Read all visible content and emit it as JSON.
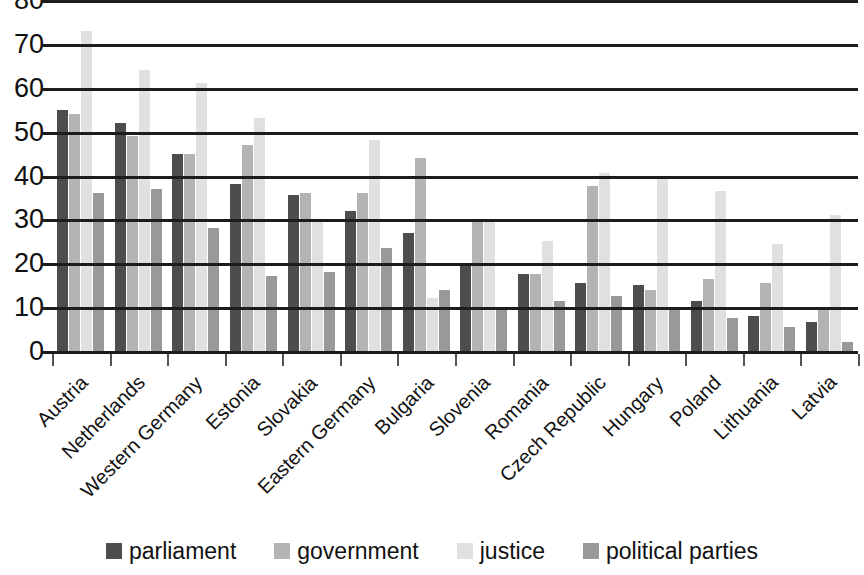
{
  "chart_data": {
    "type": "bar",
    "title": "",
    "subtitle": "",
    "xlabel": "",
    "ylabel": "",
    "ylim": [
      0,
      80
    ],
    "yticks": [
      0,
      10,
      20,
      30,
      40,
      50,
      60,
      70,
      80
    ],
    "grid": true,
    "grid_axis": "y",
    "legend_position": "bottom",
    "orientation": "vertical",
    "grouped": true,
    "categories": [
      "Austria",
      "Netherlands",
      "Western Germany",
      "Estonia",
      "Slovakia",
      "Eastern Germany",
      "Bulgaria",
      "Slovenia",
      "Romania",
      "Czech Republic",
      "Hungary",
      "Poland",
      "Lithuania",
      "Latvia"
    ],
    "series": [
      {
        "name": "parliament",
        "color": "#4d4d4d",
        "values": [
          55,
          52,
          45,
          38,
          35.5,
          32,
          27,
          19.5,
          17.5,
          15.5,
          15,
          11.5,
          8,
          6.5
        ]
      },
      {
        "name": "government",
        "color": "#b3b3b3",
        "values": [
          54,
          49,
          45,
          47,
          36,
          36,
          44,
          30,
          17.5,
          37.5,
          14,
          16.5,
          15.5,
          10
        ]
      },
      {
        "name": "justice",
        "color": "#e0e0e0",
        "values": [
          73,
          64,
          61,
          53,
          30,
          48,
          12,
          29.5,
          25,
          40.5,
          40,
          36.5,
          24.5,
          31
        ]
      },
      {
        "name": "political parties",
        "color": "#999999",
        "values": [
          36,
          37,
          28,
          17,
          18,
          23.5,
          14,
          10,
          11.5,
          12.5,
          10,
          7.5,
          5.5,
          2
        ]
      }
    ]
  },
  "legend": {
    "items": [
      {
        "label": "parliament",
        "swatch": "#4d4d4d"
      },
      {
        "label": "government",
        "swatch": "#b3b3b3"
      },
      {
        "label": "justice",
        "swatch": "#e0e0e0"
      },
      {
        "label": "political parties",
        "swatch": "#999999"
      }
    ]
  }
}
